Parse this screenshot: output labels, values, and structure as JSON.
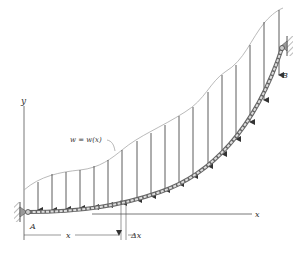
{
  "figure": {
    "load_label": "w = w(x)",
    "support_a_label": "A",
    "support_b_label": "B",
    "x_axis_label": "x",
    "y_axis_label": "y",
    "dimension_x_label": "x",
    "dimension_dx_label": "Δx"
  },
  "colors": {
    "line": "#444444",
    "load_curve": "#9a9a9a",
    "cable": "#666666",
    "support": "#888888"
  }
}
